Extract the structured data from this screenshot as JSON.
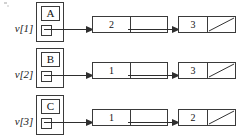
{
  "diagram": {
    "type": "linked-list",
    "line_color": "#3a3a3a",
    "text_color": "#111111",
    "background": "#ffffff",
    "rows": [
      {
        "vertex_label": "v[1]",
        "head_letter": "A",
        "head_pointer": "",
        "nodes": [
          {
            "value": "2",
            "next": "pointer"
          },
          {
            "value": "3",
            "next": "null"
          }
        ]
      },
      {
        "vertex_label": "v[2]",
        "head_letter": "B",
        "head_pointer": "",
        "nodes": [
          {
            "value": "1",
            "next": "pointer"
          },
          {
            "value": "3",
            "next": "null"
          }
        ]
      },
      {
        "vertex_label": "v[3]",
        "head_letter": "C",
        "head_pointer": "",
        "nodes": [
          {
            "value": "1",
            "next": "pointer"
          },
          {
            "value": "2",
            "next": "null"
          }
        ]
      }
    ]
  }
}
